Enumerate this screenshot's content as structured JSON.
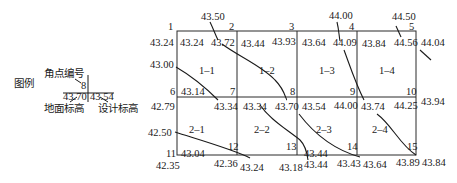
{
  "legend": {
    "title": "图例",
    "corner_label": "角点编号",
    "corner_number": "8",
    "ground_elev": "43.70",
    "design_elev": "43.54",
    "ground_label": "地面标高",
    "design_label": "设计标高"
  },
  "corners": [
    {
      "no": "1",
      "ground": "43.24",
      "design": "43.24"
    },
    {
      "no": "2",
      "ground": "43.72",
      "design": "43.44"
    },
    {
      "no": "3",
      "ground": "43.93",
      "design": "43.64"
    },
    {
      "no": "4",
      "ground": "44.09",
      "design": "43.84"
    },
    {
      "no": "5",
      "ground": "44.56",
      "design": "44.04"
    },
    {
      "no": "6",
      "ground": "43.14",
      "design": "42.79"
    },
    {
      "no": "7",
      "ground": "43.34",
      "design": "43.34"
    },
    {
      "no": "8",
      "ground": "43.70",
      "design": "43.54"
    },
    {
      "no": "9",
      "ground": "44.00",
      "design": "43.74"
    },
    {
      "no": "10",
      "ground": "44.25",
      "design": "43.94"
    },
    {
      "no": "11",
      "ground": "43.04",
      "design": "42.35"
    },
    {
      "no": "12",
      "ground": "42.36",
      "design": "43.24"
    },
    {
      "no": "13",
      "ground": "43.18",
      "design": "43.44"
    },
    {
      "no": "14",
      "ground": "43.44",
      "design": "43.43"
    },
    {
      "no": "15",
      "ground": "43.64",
      "design": "43.89"
    }
  ],
  "extra_labels": {
    "top_43_50": "43.50",
    "top_44_00": "44.00",
    "top_44_50": "44.50",
    "left_43_00": "43.00",
    "left_42_50": "42.50",
    "right_44_04": "44.04",
    "right_43_94": "43.94",
    "bottom_43_84": "43.84"
  },
  "cells": [
    {
      "id": "1-1"
    },
    {
      "id": "1-2"
    },
    {
      "id": "1-3"
    },
    {
      "id": "1-4"
    },
    {
      "id": "2-1"
    },
    {
      "id": "2-2"
    },
    {
      "id": "2-3"
    },
    {
      "id": "2-4"
    }
  ],
  "texts": {
    "c1": "1",
    "c2": "2",
    "c3": "3",
    "c4": "4",
    "c5": "5",
    "c6": "6",
    "c7": "7",
    "c8": "8",
    "c9": "9",
    "c10": "10",
    "c11": "11",
    "c12": "12",
    "c13": "13",
    "c14": "14",
    "c15": "15",
    "v_1_left": "43.24",
    "v_1_in": "43.24",
    "v_2_in": "43.72",
    "v_3_a": "43.44",
    "v_3_b": "43.93",
    "v_4_a": "43.64",
    "v_4_b": "44.09",
    "v_5_a": "43.84",
    "v_5_b": "44.56",
    "v_5_right": "44.04",
    "v_6_in": "43.14",
    "v_6_left": "42.79",
    "v_7_in": "43.34",
    "v_8_a": "43.34",
    "v_8_b": "43.70",
    "v_9_a": "43.54",
    "v_9_b": "44.00",
    "v_10_a": "43.74",
    "v_10_b": "44.25",
    "v_10_right": "43.94",
    "v_11_in": "43.04",
    "v_11_left": "42.35",
    "v_12_below": "42.36",
    "v_12_b": "43.24",
    "v_13_below": "43.18",
    "v_14_a": "43.44",
    "v_14_below": "43.44",
    "v_14_b": "43.43",
    "v_15_a": "43.64",
    "v_15_b": "43.89",
    "v_15_right": "43.84",
    "cell_1_1": "1–1",
    "cell_1_2": "1–2",
    "cell_1_3": "1–3",
    "cell_1_4": "1–4",
    "cell_2_1": "2–1",
    "cell_2_2": "2–2",
    "cell_2_3": "2–3",
    "cell_2_4": "2–4"
  }
}
